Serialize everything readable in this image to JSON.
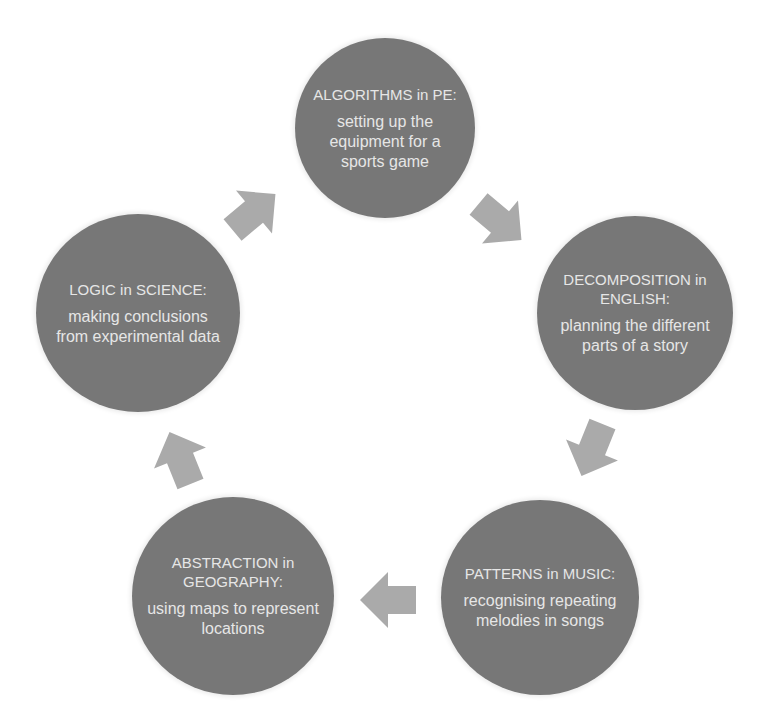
{
  "diagram": {
    "type": "cycle",
    "colors": {
      "node_fill": "#777777",
      "node_text": "#e6e6e6",
      "arrow_fill": "#aaaaaa",
      "background": "#ffffff"
    },
    "nodes": [
      {
        "id": "algorithms",
        "title": "ALGORITHMS in PE:",
        "description": "setting up the equipment for a sports game"
      },
      {
        "id": "decomposition",
        "title": "DECOMPOSITION in ENGLISH:",
        "description": "planning the different parts of a story"
      },
      {
        "id": "patterns",
        "title": "PATTERNS in MUSIC:",
        "description": "recognising repeating melodies in songs"
      },
      {
        "id": "abstraction",
        "title": "ABSTRACTION in GEOGRAPHY:",
        "description": "using maps to represent locations"
      },
      {
        "id": "logic",
        "title": "LOGIC in SCIENCE:",
        "description": "making conclusions from experimental data"
      }
    ],
    "arrows": [
      {
        "from": "algorithms",
        "to": "decomposition",
        "direction": "down-right"
      },
      {
        "from": "decomposition",
        "to": "patterns",
        "direction": "down-left"
      },
      {
        "from": "patterns",
        "to": "abstraction",
        "direction": "left"
      },
      {
        "from": "abstraction",
        "to": "logic",
        "direction": "up-left"
      },
      {
        "from": "logic",
        "to": "algorithms",
        "direction": "up-right"
      }
    ]
  }
}
